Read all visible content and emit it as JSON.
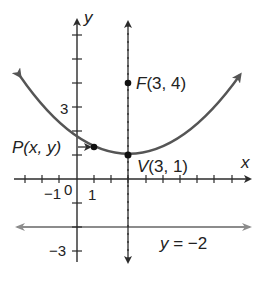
{
  "diagram": {
    "type": "parabola-focus-directrix",
    "axes": {
      "x_label": "x",
      "y_label": "y",
      "origin_label": "0",
      "tick_labels": {
        "x_one": "1",
        "x_neg_one": "−1",
        "y_three": "3",
        "y_neg_three": "−3"
      }
    },
    "points": {
      "focus": {
        "name": "F",
        "coords": "(3, 4)",
        "x": 3,
        "y": 4
      },
      "vertex": {
        "name": "V",
        "coords": "(3, 1)",
        "x": 3,
        "y": 1
      },
      "general": {
        "name": "P",
        "coords": "(x, y)",
        "x": 1,
        "y": 1.33
      }
    },
    "directrix": {
      "label_var": "y",
      "label_eq": " = −2",
      "y": -2
    },
    "axis_of_symmetry": {
      "x": 3,
      "style": "dashed"
    },
    "parabola_equation": "(x − 3)² = 12(y − 1)",
    "colors": {
      "axes": "#2b2b2b",
      "parabola": "#555555",
      "directrix": "#8c8c8c",
      "points": "#111111",
      "text": "#222222"
    }
  }
}
